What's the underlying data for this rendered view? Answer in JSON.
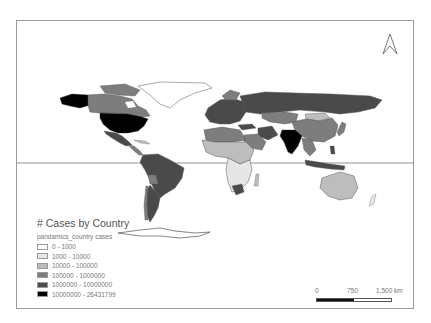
{
  "map": {
    "title": "# Cases by Country",
    "field": "pandamics_country cases",
    "colors": {
      "frame": "#9a9a9a",
      "equator": "#777777",
      "class0": "#ffffff",
      "class1": "#e6e6e6",
      "class2": "#bdbdbd",
      "class3": "#7d7d7d",
      "class4": "#4a4a4a",
      "class5": "#000000"
    },
    "legend": {
      "items": [
        {
          "label": "0 - 1000",
          "color": "#ffffff"
        },
        {
          "label": "1000 - 10000",
          "color": "#e6e6e6"
        },
        {
          "label": "10000 - 100000",
          "color": "#bdbdbd"
        },
        {
          "label": "100000 - 1000000",
          "color": "#7d7d7d"
        },
        {
          "label": "1000000 - 10000000",
          "color": "#4a4a4a"
        },
        {
          "label": "10000000 - 26431799",
          "color": "#000000"
        }
      ]
    },
    "scalebar": {
      "labels": [
        "0",
        "750",
        "1,500 km"
      ]
    },
    "north_arrow": "north-arrow-icon",
    "highlighted_countries": {
      "highest_class": [
        "United States",
        "India"
      ],
      "class_1M_10M": [
        "Russia",
        "Brazil",
        "Argentina",
        "Colombia",
        "Peru",
        "Mexico",
        "South Africa",
        "Iran",
        "Indonesia",
        "Europe (most)",
        "Turkey"
      ],
      "class_100k_1M": [
        "Canada",
        "Kazakhstan",
        "China",
        "Saudi Arabia",
        "Egypt",
        "Ethiopia",
        "Chile",
        "Bolivia",
        "Japan"
      ],
      "class_10k_100k": [
        "Australia",
        "Mongolia",
        "Most of Africa",
        "Greenland"
      ]
    }
  }
}
